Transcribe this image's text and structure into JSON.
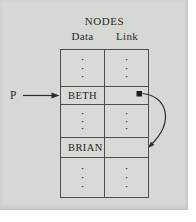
{
  "figure": {
    "title": "NODES",
    "columns": {
      "data": "Data",
      "link": "Link"
    },
    "pointer_label": "P",
    "nodes": {
      "beth": "BETH",
      "brian": "BRIAN"
    },
    "dot": "·"
  },
  "colors": {
    "page": "#ffffff",
    "panel_background": "#d6d8d3",
    "table_line": "#4e4e4c",
    "text": "#2b2b2b",
    "arrow": "#2e2e2c",
    "link_square": "#1c1c1a"
  }
}
